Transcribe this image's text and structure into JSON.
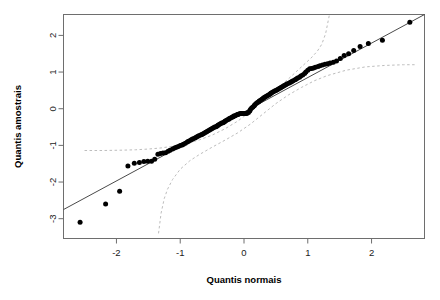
{
  "chart_data": {
    "type": "scatter",
    "title": "",
    "subtitle": "",
    "xlabel": "Quantis normais",
    "ylabel": "Quantis amostrais",
    "xlim": [
      -2.83,
      2.83
    ],
    "ylim": [
      -3.54,
      2.57
    ],
    "xticks": [
      -2,
      -1,
      0,
      1,
      2
    ],
    "xticklabels": [
      "-2",
      "-1",
      "0",
      "1",
      "2"
    ],
    "yticks": [
      2,
      1,
      0,
      -1,
      -2,
      -3
    ],
    "yticklabels": [
      "2",
      "1",
      "0",
      "-1",
      "-2",
      "-3"
    ],
    "grid": false,
    "legend": false,
    "legend_position": "none",
    "point_color": "#000000",
    "line_color": "#4a4a4a",
    "band_color": "#bdbdbd",
    "box_color": "#6e6e6e",
    "series": [
      {
        "name": "sample quantiles",
        "type": "scatter",
        "x": [
          -2.57,
          -2.17,
          -1.95,
          -1.82,
          -1.72,
          -1.64,
          -1.57,
          -1.51,
          -1.45,
          -1.4,
          -1.35,
          -1.31,
          -1.27,
          -1.23,
          -1.19,
          -1.16,
          -1.12,
          -1.09,
          -1.06,
          -1.03,
          -1.0,
          -0.97,
          -0.95,
          -0.92,
          -0.89,
          -0.87,
          -0.84,
          -0.82,
          -0.8,
          -0.77,
          -0.75,
          -0.73,
          -0.71,
          -0.68,
          -0.66,
          -0.64,
          -0.62,
          -0.6,
          -0.58,
          -0.56,
          -0.54,
          -0.52,
          -0.5,
          -0.48,
          -0.46,
          -0.44,
          -0.42,
          -0.41,
          -0.39,
          -0.37,
          -0.35,
          -0.33,
          -0.31,
          -0.3,
          -0.28,
          -0.26,
          -0.24,
          -0.23,
          -0.21,
          -0.19,
          -0.17,
          -0.16,
          -0.14,
          -0.12,
          -0.1,
          -0.09,
          -0.07,
          -0.05,
          -0.04,
          -0.02,
          0.0,
          0.02,
          0.04,
          0.05,
          0.07,
          0.09,
          0.1,
          0.12,
          0.14,
          0.16,
          0.17,
          0.19,
          0.21,
          0.23,
          0.24,
          0.26,
          0.28,
          0.3,
          0.31,
          0.33,
          0.35,
          0.37,
          0.39,
          0.41,
          0.42,
          0.44,
          0.46,
          0.48,
          0.5,
          0.52,
          0.54,
          0.56,
          0.58,
          0.6,
          0.62,
          0.64,
          0.66,
          0.68,
          0.71,
          0.73,
          0.75,
          0.77,
          0.8,
          0.82,
          0.84,
          0.87,
          0.89,
          0.92,
          0.95,
          0.97,
          1.0,
          1.03,
          1.06,
          1.09,
          1.12,
          1.16,
          1.19,
          1.23,
          1.27,
          1.31,
          1.35,
          1.4,
          1.45,
          1.51,
          1.57,
          1.64,
          1.72,
          1.82,
          1.95,
          2.17,
          2.6
        ],
        "y": [
          -3.1,
          -2.6,
          -2.25,
          -1.56,
          -1.49,
          -1.47,
          -1.44,
          -1.43,
          -1.43,
          -1.38,
          -1.24,
          -1.22,
          -1.21,
          -1.2,
          -1.16,
          -1.13,
          -1.1,
          -1.07,
          -1.05,
          -1.03,
          -1.0,
          -0.99,
          -0.97,
          -0.94,
          -0.91,
          -0.89,
          -0.86,
          -0.84,
          -0.82,
          -0.8,
          -0.78,
          -0.76,
          -0.74,
          -0.72,
          -0.7,
          -0.68,
          -0.66,
          -0.64,
          -0.62,
          -0.6,
          -0.58,
          -0.56,
          -0.54,
          -0.52,
          -0.5,
          -0.49,
          -0.47,
          -0.45,
          -0.43,
          -0.41,
          -0.39,
          -0.38,
          -0.36,
          -0.34,
          -0.32,
          -0.3,
          -0.29,
          -0.27,
          -0.25,
          -0.23,
          -0.22,
          -0.2,
          -0.19,
          -0.17,
          -0.16,
          -0.15,
          -0.14,
          -0.13,
          -0.13,
          -0.13,
          -0.13,
          -0.13,
          -0.13,
          -0.12,
          -0.1,
          -0.06,
          -0.02,
          0.02,
          0.05,
          0.08,
          0.11,
          0.14,
          0.17,
          0.19,
          0.21,
          0.23,
          0.26,
          0.28,
          0.3,
          0.32,
          0.34,
          0.36,
          0.38,
          0.4,
          0.42,
          0.44,
          0.46,
          0.48,
          0.5,
          0.52,
          0.54,
          0.56,
          0.58,
          0.6,
          0.62,
          0.64,
          0.66,
          0.68,
          0.7,
          0.72,
          0.74,
          0.76,
          0.79,
          0.81,
          0.84,
          0.86,
          0.89,
          0.92,
          0.96,
          1.0,
          1.05,
          1.09,
          1.1,
          1.11,
          1.13,
          1.15,
          1.17,
          1.19,
          1.21,
          1.23,
          1.25,
          1.27,
          1.3,
          1.37,
          1.45,
          1.5,
          1.59,
          1.7,
          1.78,
          1.87,
          2.36
        ]
      },
      {
        "name": "reference line",
        "type": "line",
        "x": [
          -2.83,
          2.83
        ],
        "y": [
          -2.75,
          2.57
        ]
      },
      {
        "name": "upper confidence band",
        "type": "line",
        "x": [
          -2.5,
          -2.2,
          -1.9,
          -1.7,
          -1.5,
          -1.3,
          -1.1,
          -0.9,
          -0.7,
          -0.5,
          -0.3,
          -0.1,
          0.1,
          0.3,
          0.5,
          0.7,
          0.9,
          1.05,
          1.15,
          1.22,
          1.28,
          1.34
        ],
        "y": [
          -1.14,
          -1.14,
          -1.13,
          -1.12,
          -1.1,
          -1.07,
          -1.02,
          -0.95,
          -0.85,
          -0.72,
          -0.55,
          -0.34,
          -0.08,
          0.22,
          0.52,
          0.82,
          1.14,
          1.38,
          1.57,
          1.76,
          2.05,
          2.57
        ]
      },
      {
        "name": "lower confidence band",
        "type": "line",
        "x": [
          -1.34,
          -1.3,
          -1.25,
          -1.2,
          -1.12,
          -1.0,
          -0.85,
          -0.7,
          -0.5,
          -0.3,
          -0.1,
          0.1,
          0.3,
          0.5,
          0.7,
          0.9,
          1.1,
          1.3,
          1.6,
          1.9,
          2.2,
          2.5,
          2.7
        ],
        "y": [
          -3.4,
          -2.85,
          -2.45,
          -2.2,
          -1.93,
          -1.65,
          -1.42,
          -1.25,
          -1.05,
          -0.86,
          -0.66,
          -0.42,
          -0.14,
          0.14,
          0.38,
          0.58,
          0.76,
          0.9,
          1.05,
          1.14,
          1.18,
          1.2,
          1.2
        ]
      }
    ]
  }
}
